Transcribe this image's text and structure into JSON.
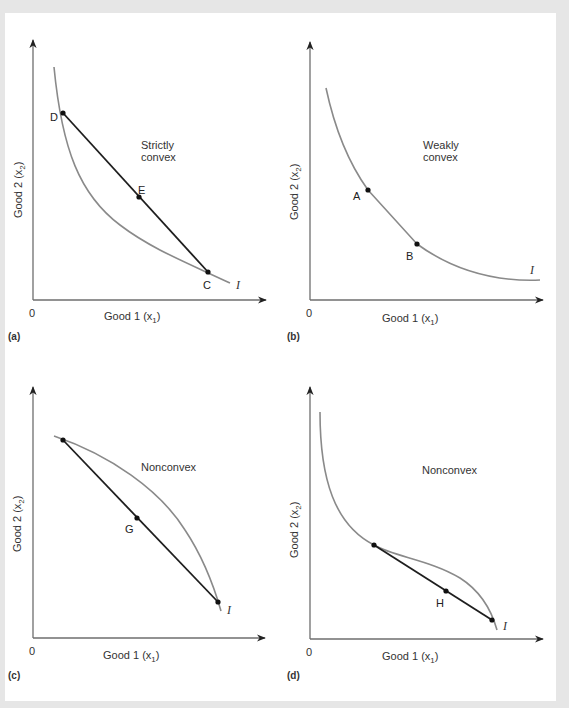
{
  "figure": {
    "panels": [
      {
        "id": "a",
        "panel_label": "(a)",
        "title_lines": [
          "Strictly",
          "convex"
        ],
        "x_label": "Good 1 (x",
        "x_sub": "1",
        "y_label": "Good 2 (x",
        "y_sub": "2",
        "origin": "0",
        "curve_label": "I",
        "points": [
          "D",
          "E",
          "C"
        ]
      },
      {
        "id": "b",
        "panel_label": "(b)",
        "title_lines": [
          "Weakly",
          "convex"
        ],
        "x_label": "Good 1 (x",
        "x_sub": "1",
        "y_label": "Good 2 (x",
        "y_sub": "2",
        "origin": "0",
        "curve_label": "I",
        "points": [
          "A",
          "B"
        ]
      },
      {
        "id": "c",
        "panel_label": "(c)",
        "title_lines": [
          "Nonconvex"
        ],
        "x_label": "Good 1 (x",
        "x_sub": "1",
        "y_label": "Good 2 (x",
        "y_sub": "2",
        "origin": "0",
        "curve_label": "I",
        "points": [
          "G"
        ]
      },
      {
        "id": "d",
        "panel_label": "(d)",
        "title_lines": [
          "Nonconvex"
        ],
        "x_label": "Good 1 (x",
        "x_sub": "1",
        "y_label": "Good 2 (x",
        "y_sub": "2",
        "origin": "0",
        "curve_label": "I",
        "points": [
          "H"
        ]
      }
    ]
  },
  "colors": {
    "background": "#e6e6e6",
    "card": "#ffffff",
    "curve": "#8a8a8a",
    "chord": "#1e1e1e",
    "axis": "#6e6e6e"
  }
}
